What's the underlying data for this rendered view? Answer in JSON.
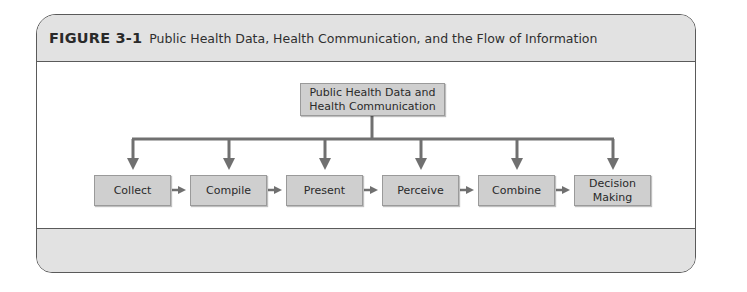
{
  "figure": {
    "label": "FIGURE 3-1",
    "title": "Public Health Data, Health Communication, and the Flow of Information"
  },
  "diagram": {
    "root": {
      "line1": "Public Health Data and",
      "line2": "Health Communication"
    },
    "steps": [
      {
        "label": "Collect"
      },
      {
        "label": "Compile"
      },
      {
        "label": "Present"
      },
      {
        "label": "Perceive"
      },
      {
        "label": "Combine"
      },
      {
        "label_line1": "Decision",
        "label_line2": "Making"
      }
    ],
    "colors": {
      "box_fill": "#cfcfcf",
      "arrow": "#707070",
      "band": "#e2e2e2",
      "border": "#5a5a5a"
    }
  }
}
